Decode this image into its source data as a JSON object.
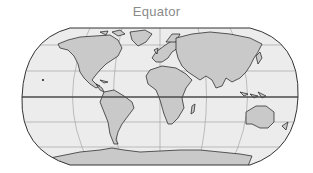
{
  "title": "Equator",
  "map": {
    "projection": "robinson",
    "highlighted_line": "Equator",
    "colors": {
      "ocean": "#ececec",
      "land": "#c9c9c9",
      "coastline": "#1a1a1a",
      "graticule": "#9a9a9a",
      "equator": "#4a4a4a",
      "border": "#333333",
      "title": "#8a8a8a"
    },
    "graticule": {
      "parallels_deg": [
        -60,
        -30,
        0,
        30,
        60
      ],
      "meridians_deg": [
        -90,
        -45,
        0,
        45,
        90
      ]
    },
    "landmasses": [
      "North America",
      "South America",
      "Europe",
      "Africa",
      "Asia",
      "Australia",
      "Antarctica",
      "Greenland"
    ]
  }
}
